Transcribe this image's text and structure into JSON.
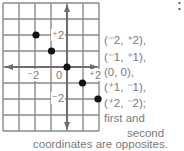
{
  "diagram": {
    "grid": {
      "cols": 6,
      "rows": 8,
      "x0": 3,
      "y0": 3,
      "cell": 16,
      "line_color": "#8a8a8a",
      "axis_color": "#6e6e6e"
    },
    "origin": {
      "x": 67,
      "y": 67
    },
    "tick_labels": [
      {
        "text": "⁻2",
        "axis": "x",
        "value": -2
      },
      {
        "text": "0",
        "axis": "x",
        "value": 0
      },
      {
        "text": "⁺2",
        "axis": "x",
        "value": 2
      },
      {
        "text": "⁺2",
        "axis": "y",
        "value": 2
      },
      {
        "text": "⁻2",
        "axis": "y",
        "value": -2
      }
    ],
    "points": [
      {
        "x": -2,
        "y": 2
      },
      {
        "x": -1,
        "y": 1
      },
      {
        "x": 0,
        "y": 0
      },
      {
        "x": 1,
        "y": -1
      },
      {
        "x": 2,
        "y": -2
      }
    ],
    "point_color": "#111111"
  },
  "text": {
    "lines": [
      "(⁻2, ⁺2),",
      "(⁻1, ⁺1),",
      "(0, 0),",
      "(⁺1, ⁻1),",
      "(⁺2, ⁻2);",
      "first and",
      "second"
    ],
    "bottom_line": "coordinates are opposites."
  }
}
